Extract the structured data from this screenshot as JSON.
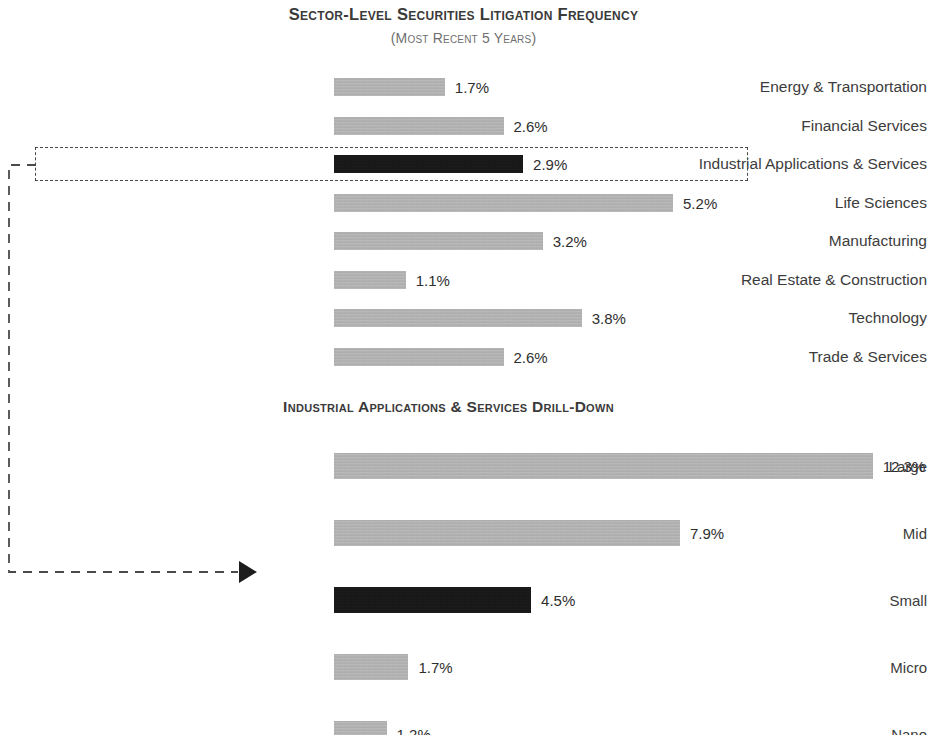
{
  "titles": {
    "main": "Sector-Level Securities Litigation Frequency",
    "subtitle": "(Most Recent 5 Years)",
    "drilldown": "Industrial Applications & Services Drill-Down"
  },
  "colors": {
    "bar": "#b2b2b2",
    "highlight_bar": "#0d0d0d",
    "text": "#3c3c3c",
    "title": "#3a3a3a",
    "subtitle": "#6f6f6f",
    "callout_border": "#4a4a4a"
  },
  "callout": {
    "highlighted_sector": "Industrial Applications & Services",
    "highlighted_drilldown_tier": "Small",
    "arrow_icon": "arrow-right-triangle"
  },
  "chart_data": [
    {
      "type": "bar",
      "orientation": "horizontal",
      "title": "Sector-Level Securities Litigation Frequency",
      "subtitle": "(Most Recent 5 Years)",
      "xlabel": "",
      "ylabel": "",
      "xlim": [
        0,
        5.2
      ],
      "grid": false,
      "legend": false,
      "value_suffix": "%",
      "categories": [
        "Energy & Transportation",
        "Financial Services",
        "Industrial Applications & Services",
        "Life Sciences",
        "Manufacturing",
        "Real Estate & Construction",
        "Technology",
        "Trade & Services"
      ],
      "values": [
        1.7,
        2.6,
        2.9,
        5.2,
        3.2,
        1.1,
        3.8,
        2.6
      ],
      "value_labels": [
        "1.7%",
        "2.6%",
        "2.9%",
        "5.2%",
        "3.2%",
        "1.1%",
        "3.8%",
        "2.6%"
      ],
      "highlighted": [
        false,
        false,
        true,
        false,
        false,
        false,
        false,
        false
      ]
    },
    {
      "type": "bar",
      "orientation": "horizontal",
      "title": "Industrial Applications & Services Drill-Down",
      "subtitle": "",
      "xlabel": "",
      "ylabel": "",
      "xlim": [
        0,
        12.3
      ],
      "grid": false,
      "legend": false,
      "value_suffix": "%",
      "categories": [
        "Large",
        "Mid",
        "Small",
        "Micro",
        "Nano"
      ],
      "values": [
        12.3,
        7.9,
        4.5,
        1.7,
        1.2
      ],
      "value_labels": [
        "12.3%",
        "7.9%",
        "4.5%",
        "1.7%",
        "1.2%"
      ],
      "highlighted": [
        false,
        false,
        true,
        false,
        false
      ]
    }
  ]
}
